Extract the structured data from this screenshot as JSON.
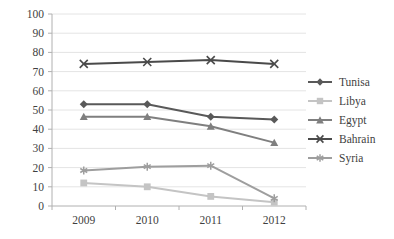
{
  "chart_data": {
    "type": "line",
    "title": "",
    "subtitle": "",
    "xlabel": "",
    "ylabel": "",
    "categories": [
      "2009",
      "2010",
      "2011",
      "2012"
    ],
    "x_tick_labels": [
      "2009",
      "2010",
      "2011",
      "2012"
    ],
    "y_tick_labels": [
      "0",
      "10",
      "20",
      "30",
      "40",
      "50",
      "60",
      "70",
      "80",
      "90",
      "100"
    ],
    "y_ticks": [
      0,
      10,
      20,
      30,
      40,
      50,
      60,
      70,
      80,
      90,
      100
    ],
    "ylim": [
      0,
      100
    ],
    "grid": "horizontal",
    "legend_position": "right",
    "series": [
      {
        "name": "Tunisa",
        "marker": "diamond",
        "color": "#595959",
        "values": [
          53,
          53,
          46.5,
          45
        ]
      },
      {
        "name": "Libya",
        "marker": "square",
        "color": "#c4c4c4",
        "values": [
          12,
          10,
          5,
          2
        ]
      },
      {
        "name": "Egypt",
        "marker": "triangle",
        "color": "#7f7f7f",
        "values": [
          46.5,
          46.5,
          41.5,
          33
        ]
      },
      {
        "name": "Bahrain",
        "marker": "x",
        "color": "#4a4a4a",
        "values": [
          74,
          75,
          76,
          74
        ]
      },
      {
        "name": "Syria",
        "marker": "asterisk",
        "color": "#9e9e9e",
        "values": [
          18.5,
          20.5,
          21,
          4
        ]
      }
    ]
  },
  "legend": {
    "items": [
      {
        "label": "Tunisa"
      },
      {
        "label": "Libya"
      },
      {
        "label": "Egypt"
      },
      {
        "label": "Bahrain"
      },
      {
        "label": "Syria"
      }
    ]
  },
  "colors": {
    "gridline": "#e4e4e4",
    "axis": "#b0b0b0",
    "text": "#3f3f3f",
    "background": "#ffffff"
  }
}
